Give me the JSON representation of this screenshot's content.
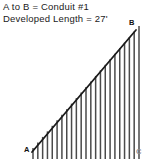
{
  "caption": {
    "line1": "A  to  B  =  Conduit #1",
    "line2": "Developed Length  =  27'"
  },
  "labels": {
    "a": "A",
    "b": "B",
    "c": "C"
  },
  "colors": {
    "ink": "#1a1a1a",
    "hatch": "#4a4a4a",
    "faint": "#8d8d8d",
    "background": "#ffffff"
  },
  "chart_data": {
    "type": "line",
    "title": "A  to  B  =  Conduit #1",
    "subtitle": "Developed Length  =  27'",
    "xlabel": "",
    "ylabel": "",
    "grid": false,
    "legend": null,
    "annotations": [
      {
        "text": "A",
        "x": 32,
        "y": 152,
        "role": "start-point"
      },
      {
        "text": "B",
        "x": 136,
        "y": 30,
        "role": "end-point"
      },
      {
        "text": "C",
        "x": 140,
        "y": 152,
        "role": "corner-point"
      }
    ],
    "series": [
      {
        "name": "conduit-run",
        "x": [
          32,
          136
        ],
        "values": [
          152,
          30
        ],
        "style": "solid-diagonal"
      }
    ],
    "hatch": {
      "count": 23,
      "x_start": 33,
      "x_end": 139,
      "baseline_y": 159,
      "top_y_start": 148,
      "top_y_end": 26,
      "overshoot": 5
    }
  }
}
